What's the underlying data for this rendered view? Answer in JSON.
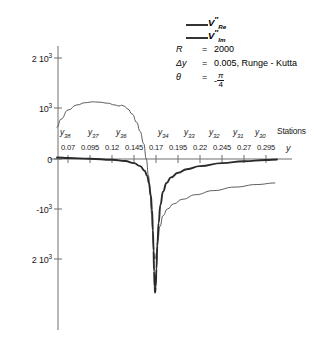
{
  "chart_data": {
    "type": "line",
    "title": "",
    "xlabel": "y",
    "ylabel": "",
    "xlim": [
      0.0575,
      0.3075
    ],
    "ylim": [
      -2600,
      2300
    ],
    "grid": false,
    "legend_position": "top-right",
    "xticks": [
      "0.07",
      "0.095",
      "0.12",
      "0.145",
      "0.17",
      "0.195",
      "0.22",
      "0.245",
      "0.27",
      "0.295"
    ],
    "xtick_values": [
      0.07,
      0.095,
      0.12,
      0.145,
      0.17,
      0.195,
      0.22,
      0.245,
      0.27,
      0.295
    ],
    "yticks": [
      "2 10",
      "10",
      "0",
      "-10",
      "2 10"
    ],
    "ytick_exponents": [
      "3",
      "3",
      "",
      "3",
      "3"
    ],
    "ytick_values": [
      2000,
      1000,
      0,
      -1000,
      -2000
    ],
    "series": [
      {
        "name": "V''_Re",
        "style": "bold",
        "x": [
          0.0575,
          0.07,
          0.095,
          0.12,
          0.135,
          0.145,
          0.152,
          0.157,
          0.16,
          0.162,
          0.164,
          0.1655,
          0.1665,
          0.1672,
          0.1678,
          0.1684,
          0.169,
          0.1697,
          0.1705,
          0.1715,
          0.173,
          0.175,
          0.178,
          0.182,
          0.187,
          0.195,
          0.205,
          0.22,
          0.245,
          0.27,
          0.295,
          0.3075
        ],
        "y": [
          30,
          20,
          5,
          -15,
          -40,
          -80,
          -140,
          -230,
          -330,
          -470,
          -700,
          -1000,
          -1400,
          -1800,
          -2200,
          -2500,
          -2620,
          -2500,
          -2150,
          -1700,
          -1250,
          -900,
          -640,
          -470,
          -360,
          -270,
          -200,
          -140,
          -80,
          -45,
          -20,
          -10
        ]
      },
      {
        "name": "V''_Im",
        "style": "thin",
        "x": [
          0.0575,
          0.062,
          0.07,
          0.08,
          0.09,
          0.098,
          0.105,
          0.115,
          0.123,
          0.128,
          0.131,
          0.134,
          0.138,
          0.143,
          0.148,
          0.152,
          0.156,
          0.159,
          0.1615,
          0.1635,
          0.165,
          0.1662,
          0.167,
          0.1678,
          0.1686,
          0.1695,
          0.1705,
          0.172,
          0.1745,
          0.178,
          0.183,
          0.19,
          0.2,
          0.215,
          0.235,
          0.26,
          0.285,
          0.305
        ],
        "y": [
          620,
          780,
          960,
          1060,
          1105,
          1120,
          1115,
          1095,
          1060,
          1040,
          1055,
          1035,
          980,
          880,
          720,
          540,
          300,
          0,
          -330,
          -720,
          -1080,
          -1400,
          -1650,
          -1840,
          -1960,
          -1950,
          -1840,
          -1600,
          -1320,
          -1110,
          -980,
          -880,
          -790,
          -700,
          -620,
          -550,
          -500,
          -470
        ]
      }
    ],
    "annotations": {
      "station_labels": [
        "y38",
        "y37",
        "y36",
        "y34",
        "y33",
        "y32",
        "y31",
        "y30"
      ],
      "station_base": "y",
      "station_subs": [
        "38",
        "37",
        "36",
        "34",
        "33",
        "32",
        "31",
        "30"
      ],
      "stations_caption": "Stations"
    },
    "parameters": [
      {
        "symbol": "R",
        "eq": "=",
        "value": "2000"
      },
      {
        "symbol": "Δy",
        "eq": "=",
        "value": "0.005, Runge - Kutta"
      },
      {
        "symbol": "θ",
        "eq": "=",
        "value": "-π/4"
      }
    ]
  },
  "legend": {
    "entries": [
      {
        "base": "V",
        "prime": "″",
        "sub": "Re"
      },
      {
        "base": "V",
        "prime": "″",
        "sub": "Im"
      }
    ]
  },
  "params_panel": {
    "reynolds": {
      "symbol": "R",
      "eq": "=",
      "value": "2000"
    },
    "dy": {
      "symbol": "Δy",
      "eq": "=",
      "value": "0.005, Runge - Kutta"
    },
    "theta": {
      "symbol": "θ",
      "eq": "=",
      "num": "π",
      "den": "4",
      "sign": "-"
    }
  },
  "axes": {
    "x_axis_name": "y",
    "y_labels": [
      {
        "mant": "2 10",
        "exp": "3"
      },
      {
        "mant": "10",
        "exp": "3"
      },
      {
        "mant": "0",
        "exp": ""
      },
      {
        "mant": "-10",
        "exp": "3"
      },
      {
        "mant": "2 10",
        "exp": "3"
      }
    ]
  }
}
